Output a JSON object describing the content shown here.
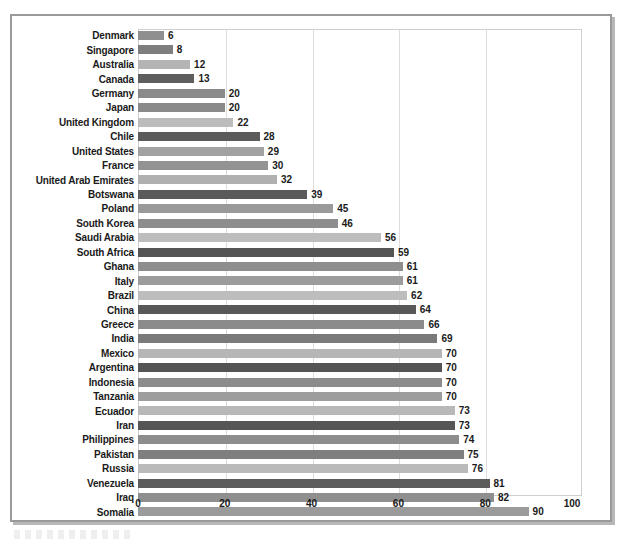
{
  "chart_data": {
    "type": "bar",
    "orientation": "horizontal",
    "title": "",
    "subtitle": "",
    "xlabel": "",
    "ylabel": "",
    "xlim": [
      0,
      100
    ],
    "ylim": null,
    "grid": true,
    "gridlines_x": [
      20,
      40,
      60,
      80
    ],
    "legend": null,
    "legend_position": "none",
    "xticks": [
      "0",
      "20",
      "40",
      "60",
      "80",
      "100"
    ],
    "xtick_values": [
      0,
      20,
      40,
      60,
      80,
      100
    ],
    "categories": [
      "Denmark",
      "Singapore",
      "Australia",
      "Canada",
      "Germany",
      "Japan",
      "United Kingdom",
      "Chile",
      "United States",
      "France",
      "United Arab Emirates",
      "Botswana",
      "Poland",
      "South Korea",
      "Saudi Arabia",
      "South Africa",
      "Ghana",
      "Italy",
      "Brazil",
      "China",
      "Greece",
      "India",
      "Mexico",
      "Argentina",
      "Indonesia",
      "Tanzania",
      "Ecuador",
      "Iran",
      "Philippines",
      "Pakistan",
      "Russia",
      "Venezuela",
      "Iraq",
      "Somalia"
    ],
    "values": [
      6,
      8,
      12,
      13,
      20,
      20,
      22,
      28,
      29,
      30,
      32,
      39,
      45,
      46,
      56,
      59,
      61,
      61,
      62,
      64,
      66,
      69,
      70,
      70,
      70,
      70,
      73,
      73,
      74,
      75,
      76,
      81,
      82,
      90
    ],
    "bar_colors": [
      "#8f8f8f",
      "#7e7e7e",
      "#b4b4b4",
      "#5e5e5e",
      "#8a8a8a",
      "#8a8a8a",
      "#bcbcbc",
      "#5b5b5b",
      "#a2a2a2",
      "#939393",
      "#b0b0b0",
      "#5a5a5a",
      "#9a9a9a",
      "#8d8d8d",
      "#bdbdbd",
      "#555555",
      "#8e8e8e",
      "#9c9c9c",
      "#bdbdbd",
      "#585858",
      "#8b8b8b",
      "#7a7a7a",
      "#b6b6b6",
      "#545454",
      "#8c8c8c",
      "#9d9d9d",
      "#b8b8b8",
      "#565656",
      "#8d8d8d",
      "#7f7f7f",
      "#bababa",
      "#5c5c5c",
      "#8f8f8f",
      "#9b9b9b"
    ]
  },
  "axis": {
    "x_tick_0": "0",
    "x_tick_20": "20",
    "x_tick_40": "40",
    "x_tick_60": "60",
    "x_tick_80": "80",
    "x_tick_100": "100"
  }
}
